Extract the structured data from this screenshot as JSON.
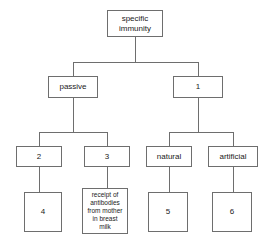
{
  "diagram": {
    "type": "tree",
    "nodes": {
      "root": {
        "label": "specific\nimmunity"
      },
      "passive": {
        "label": "passive"
      },
      "blank1": {
        "label": "1"
      },
      "blank2": {
        "label": "2"
      },
      "blank3": {
        "label": "3"
      },
      "natural": {
        "label": "natural"
      },
      "artificial": {
        "label": "artificial"
      },
      "blank4": {
        "label": "4"
      },
      "milk": {
        "label": "receipt of\nantibodies\nfrom mother\nin breast\nmilk"
      },
      "blank5": {
        "label": "5"
      },
      "blank6": {
        "label": "6"
      }
    },
    "edges": [
      {
        "from": "root",
        "to": "passive"
      },
      {
        "from": "root",
        "to": "blank1"
      },
      {
        "from": "passive",
        "to": "blank2"
      },
      {
        "from": "passive",
        "to": "blank3"
      },
      {
        "from": "blank1",
        "to": "natural"
      },
      {
        "from": "blank1",
        "to": "artificial"
      },
      {
        "from": "blank2",
        "to": "blank4"
      },
      {
        "from": "blank3",
        "to": "milk"
      },
      {
        "from": "natural",
        "to": "blank5"
      },
      {
        "from": "artificial",
        "to": "blank6"
      }
    ],
    "colors": {
      "background": "#ffffff",
      "box_border": "#6e6e6e",
      "connector": "#6e6e6e",
      "text": "#1a1a1a"
    }
  }
}
